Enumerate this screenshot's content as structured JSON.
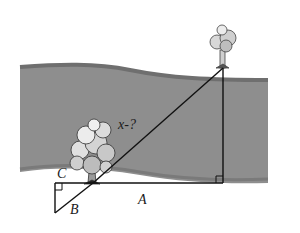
{
  "diagram": {
    "type": "geometry-river-width",
    "labels": {
      "hypotenuse": "x-?",
      "long_leg": "A",
      "small_vertical": "B",
      "small_horizontal": "C"
    },
    "colors": {
      "background": "#ffffff",
      "river_fill": "#8e8e8e",
      "river_edge": "#6f6f6f",
      "lines": "#111111",
      "tree_fill": "#d9d9d9",
      "tree_outline": "#333333"
    },
    "objects": [
      "near-bank-tree",
      "far-bank-tree",
      "river",
      "large-right-triangle",
      "small-right-triangle"
    ]
  }
}
